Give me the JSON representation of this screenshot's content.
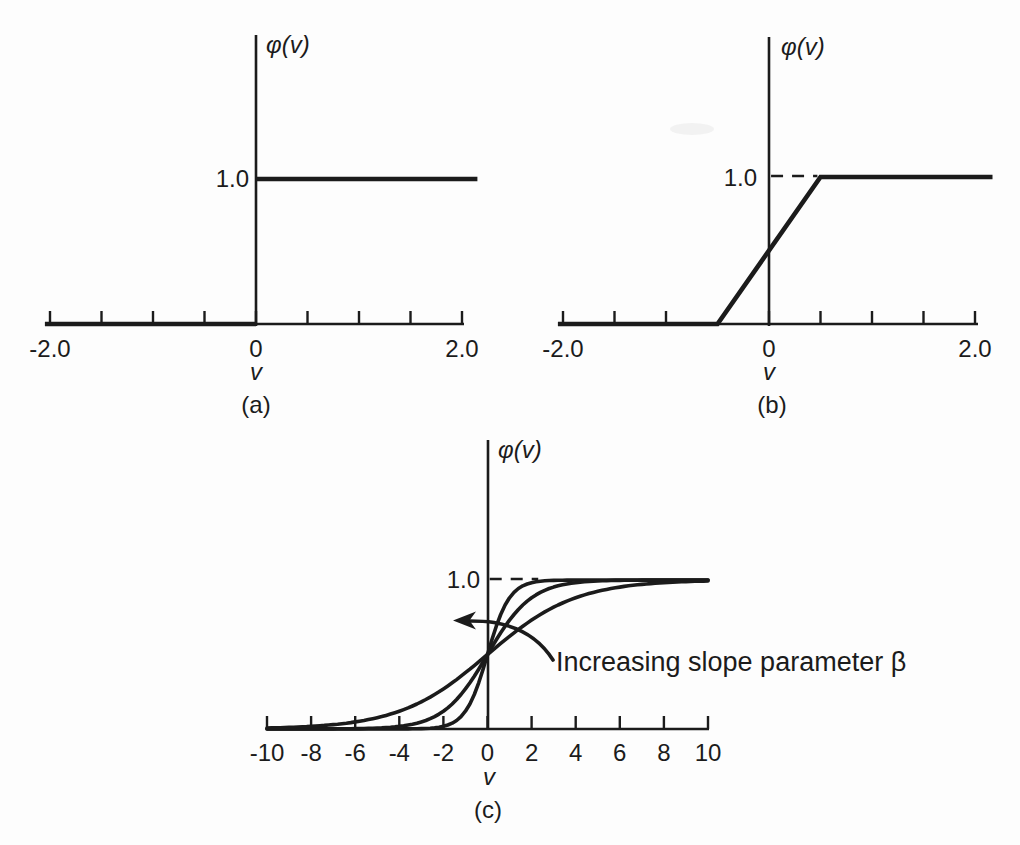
{
  "figure": {
    "background": "#fdfdfd",
    "ink": "#1b1b1b"
  },
  "chart_data": [
    {
      "id": "a",
      "type": "line",
      "caption": "(a)",
      "xlabel": "v",
      "ylabel": "φ(v)",
      "function": "Threshold function: φ(v) = 1 if v ≥ 0, 0 if v < 0",
      "xlim": [
        -2.05,
        2.15
      ],
      "ylim": [
        0,
        2
      ],
      "grid": false,
      "x_ticks": [
        -2,
        -1.5,
        -1,
        -0.5,
        0,
        0.5,
        1,
        1.5,
        2
      ],
      "x_tick_labels": [
        {
          "value": -2,
          "label": "-2.0"
        },
        {
          "value": 0,
          "label": "0"
        },
        {
          "value": 2,
          "label": "2.0"
        }
      ],
      "y_ref_label": {
        "value": 1.0,
        "label": "1.0"
      },
      "series": [
        {
          "name": "threshold",
          "segments": [
            [
              [
                -2.05,
                0
              ],
              [
                0,
                0
              ]
            ],
            [
              [
                0,
                1
              ],
              [
                2.15,
                1
              ]
            ]
          ]
        }
      ]
    },
    {
      "id": "b",
      "type": "line",
      "caption": "(b)",
      "xlabel": "v",
      "ylabel": "φ(v)",
      "function": "Piecewise-linear function: φ(v) = 0 for v ≤ -0.5, v + 0.5 for -0.5 < v < 0.5, 1 for v ≥ 0.5",
      "xlim": [
        -2.05,
        2.17
      ],
      "ylim": [
        0,
        2
      ],
      "grid": false,
      "x_ticks": [
        -2,
        -1.5,
        -1,
        0,
        0.5,
        1,
        1.5,
        2
      ],
      "x_tick_labels": [
        {
          "value": -2,
          "label": "-2.0"
        },
        {
          "value": 0,
          "label": "0"
        },
        {
          "value": 2,
          "label": "2.0"
        }
      ],
      "y_ref_label": {
        "value": 1.0,
        "label": "1.0"
      },
      "dashed_guide": {
        "y": 1,
        "x_from": 0.02,
        "x_to": 0.47
      },
      "series": [
        {
          "name": "piecewise-linear",
          "segments": [
            [
              [
                -2.05,
                0
              ],
              [
                -0.5,
                0
              ],
              [
                0.5,
                1
              ],
              [
                2.17,
                1
              ]
            ]
          ]
        }
      ]
    },
    {
      "id": "c",
      "type": "line",
      "caption": "(c)",
      "xlabel": "v",
      "ylabel": "φ(v)",
      "function": "Sigmoid function: φ(v) = 1 / (1 + exp(-βv)) for varying slope parameter β",
      "xlim": [
        -10,
        10
      ],
      "ylim": [
        0,
        2
      ],
      "grid": false,
      "x_ticks": [
        -10,
        -8,
        -6,
        -4,
        -2,
        0,
        2,
        4,
        6,
        8,
        10
      ],
      "x_tick_labels": [
        {
          "value": -10,
          "label": "-10"
        },
        {
          "value": -8,
          "label": "-8"
        },
        {
          "value": -6,
          "label": "-6"
        },
        {
          "value": -4,
          "label": "-4"
        },
        {
          "value": -2,
          "label": "-2"
        },
        {
          "value": 0,
          "label": "0"
        },
        {
          "value": 2,
          "label": "2"
        },
        {
          "value": 4,
          "label": "4"
        },
        {
          "value": 6,
          "label": "6"
        },
        {
          "value": 8,
          "label": "8"
        },
        {
          "value": 10,
          "label": "10"
        }
      ],
      "y_ref_label": {
        "value": 1.0,
        "label": "1.0"
      },
      "dashed_guide": {
        "y": 1,
        "x_from": 0.1,
        "x_to": 2.3
      },
      "series": [
        {
          "name": "sigmoid, large β",
          "beta": 2.0
        },
        {
          "name": "sigmoid, medium β",
          "beta": 1.0
        },
        {
          "name": "sigmoid, small β",
          "beta": 0.5
        }
      ],
      "annotation": {
        "text": "Increasing slope parameter β"
      }
    }
  ]
}
